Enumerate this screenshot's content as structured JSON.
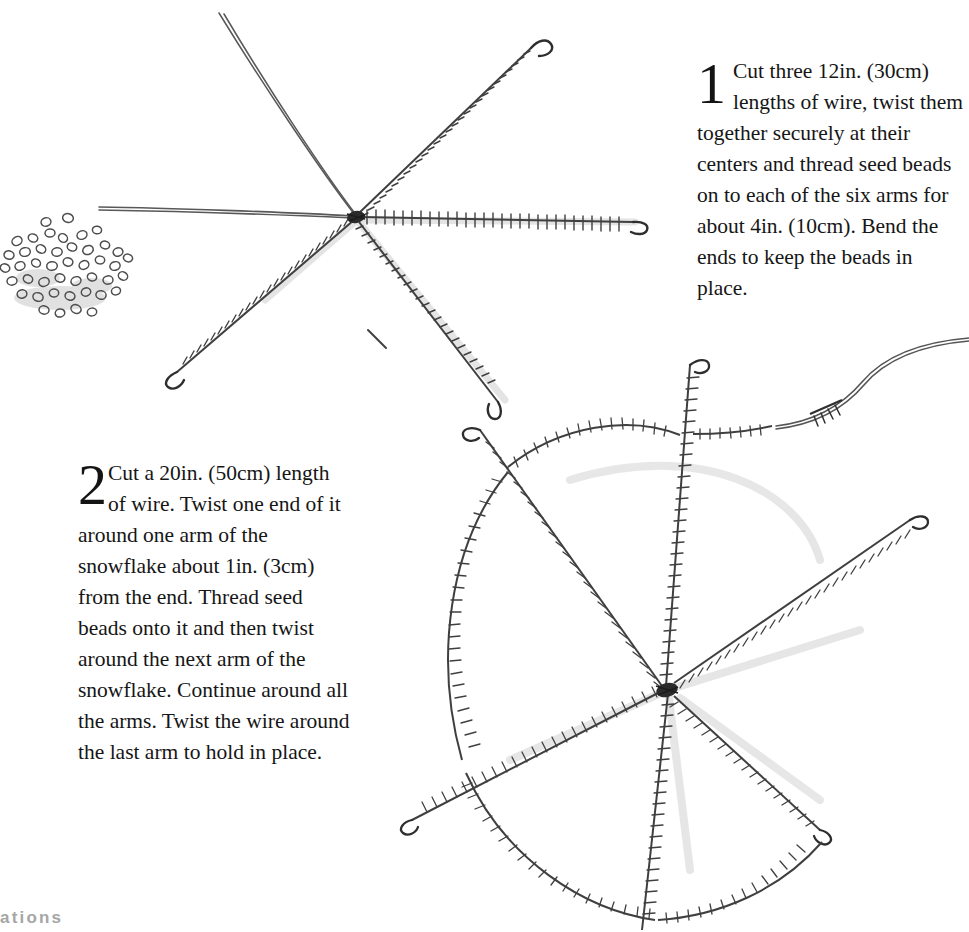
{
  "page": {
    "background_color": "#ffffff",
    "ink_color": "#1a1a1a",
    "pencil_color": "#4a4a4a",
    "shadow_color": "#c9c9c9",
    "running_head_color": "#a6a6a6",
    "running_head_partial": "ations",
    "width": 969,
    "height": 932
  },
  "steps": [
    {
      "number": "1",
      "text": "Cut three 12in. (30cm) lengths of wire, twist them together securely at their centers and thread seed beads on to each of the six arms for about 4in. (10cm). Bend the ends to keep the beads in place."
    },
    {
      "number": "2",
      "text": "Cut a 20in. (50cm) length of wire. Twist one end of it around one arm of the snowflake about 1in. (3cm) from the end. Thread seed beads onto it and then twist around the next arm of the snowflake. Continue around all the arms. Twist the wire around the last arm to hold in place."
    }
  ],
  "illustrations": [
    {
      "name": "seed-bead-pile",
      "caption": "Scattered pile of small ring-shaped seed beads",
      "bead_count": 44
    },
    {
      "name": "snowflake-step-1",
      "caption": "Six wire arms twisted together at the center, four arms threaded with seed beads and bent into small hooks at the ends",
      "arm_count": 6,
      "beaded_arms": 4,
      "plain_arms": 2
    },
    {
      "name": "snowflake-step-2",
      "caption": "Beaded snowflake with a second beaded wire woven in arcs between the six arms, loose wire tail trailing off at the upper right",
      "arm_count": 6,
      "web_arc_count": 6,
      "has_loose_wire_tail": true
    }
  ]
}
